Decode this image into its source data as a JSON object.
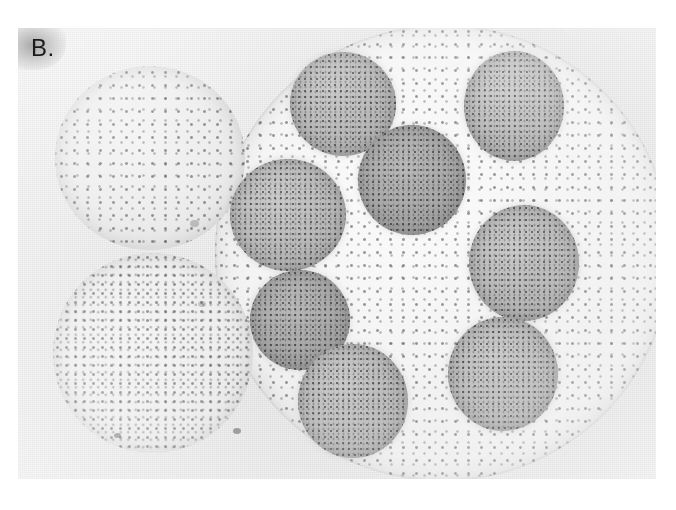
{
  "figure": {
    "panel_label": "B.",
    "kind": "light-micrograph",
    "background_color": "#ffffff",
    "plate_color": "#eeeeee"
  },
  "plate": {
    "x": 18,
    "y": 28,
    "width": 638,
    "height": 451
  },
  "colors": {
    "plate_background": "#eeeeee",
    "parent_colony": "#f2f2f2",
    "daughter_colony": "#b6b6b6",
    "daughter_colony_dark": "#a4a4a4",
    "sibling_colony": "#ececec",
    "cell_dot": "#3c3c3c",
    "label_text": "#1b1b1b"
  },
  "objects": {
    "parent_colony": {
      "name": "large parent Volvox colony",
      "cx": 443,
      "cy": 253,
      "r": 228
    },
    "sibling_colonies": [
      {
        "name": "upper-left Volvox colony",
        "cx": 150,
        "cy": 158,
        "rx": 95,
        "ry": 92
      },
      {
        "name": "lower-left Volvox colony",
        "cx": 153,
        "cy": 353,
        "rx": 100,
        "ry": 100
      }
    ],
    "daughter_colonies": [
      {
        "name": "daughter-top-left",
        "cx": 343,
        "cy": 104,
        "rx": 53,
        "ry": 52,
        "shade": "light"
      },
      {
        "name": "daughter-top-right",
        "cx": 514,
        "cy": 106,
        "rx": 50,
        "ry": 55,
        "shade": "light"
      },
      {
        "name": "daughter-center",
        "cx": 412,
        "cy": 180,
        "rx": 54,
        "ry": 55,
        "shade": "dark"
      },
      {
        "name": "daughter-mid-left",
        "cx": 288,
        "cy": 215,
        "rx": 58,
        "ry": 56,
        "shade": "light"
      },
      {
        "name": "daughter-right",
        "cx": 524,
        "cy": 263,
        "rx": 55,
        "ry": 58,
        "shade": "light"
      },
      {
        "name": "daughter-lower-left",
        "cx": 300,
        "cy": 320,
        "rx": 50,
        "ry": 50,
        "shade": "dark"
      },
      {
        "name": "daughter-lower-right",
        "cx": 503,
        "cy": 375,
        "rx": 55,
        "ry": 57,
        "shade": "light"
      },
      {
        "name": "daughter-bottom-center",
        "cx": 353,
        "cy": 402,
        "rx": 55,
        "ry": 57,
        "shade": "light"
      }
    ]
  }
}
